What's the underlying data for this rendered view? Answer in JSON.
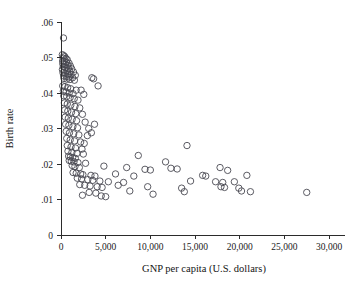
{
  "figure": {
    "width": 362,
    "height": 286,
    "background": "#ffffff",
    "marker_color": "#4a4a52",
    "axis_color": "#2b2b2b",
    "text_color": "#1a1a1a"
  },
  "chart_data": {
    "type": "scatter",
    "title": "",
    "xlabel": "GNP per capita (U.S. dollars)",
    "ylabel": "Birth rate",
    "xlim": [
      0,
      31000
    ],
    "ylim": [
      0,
      0.06
    ],
    "grid": false,
    "legend": null,
    "marker": {
      "shape": "circle-open",
      "size": 3.2,
      "fill": "none",
      "edge_color": "#4a4a52"
    },
    "xticks": [
      0,
      5000,
      10000,
      15000,
      20000,
      25000,
      30000
    ],
    "xticklabels": [
      "0",
      "5,000",
      "10,000",
      "15,000",
      "20,000",
      "25,000",
      "30,000"
    ],
    "yticks": [
      0,
      0.01,
      0.02,
      0.03,
      0.04,
      0.05,
      0.06
    ],
    "yticklabels": [
      "0",
      ".01",
      ".02",
      ".03",
      ".04",
      ".05",
      ".06"
    ],
    "points": [
      [
        280,
        0.0555
      ],
      [
        150,
        0.0508
      ],
      [
        320,
        0.0505
      ],
      [
        430,
        0.0502
      ],
      [
        240,
        0.0498
      ],
      [
        560,
        0.0497
      ],
      [
        700,
        0.0494
      ],
      [
        180,
        0.049
      ],
      [
        350,
        0.0489
      ],
      [
        620,
        0.0486
      ],
      [
        900,
        0.0484
      ],
      [
        200,
        0.0482
      ],
      [
        480,
        0.048
      ],
      [
        760,
        0.0478
      ],
      [
        1050,
        0.0476
      ],
      [
        260,
        0.0474
      ],
      [
        540,
        0.0472
      ],
      [
        830,
        0.047
      ],
      [
        1200,
        0.0468
      ],
      [
        160,
        0.0466
      ],
      [
        400,
        0.0464
      ],
      [
        680,
        0.0463
      ],
      [
        980,
        0.0461
      ],
      [
        1400,
        0.0459
      ],
      [
        220,
        0.0457
      ],
      [
        500,
        0.0455
      ],
      [
        790,
        0.0453
      ],
      [
        1120,
        0.0452
      ],
      [
        1600,
        0.045
      ],
      [
        300,
        0.0448
      ],
      [
        600,
        0.0446
      ],
      [
        880,
        0.0445
      ],
      [
        1300,
        0.0443
      ],
      [
        340,
        0.0441
      ],
      [
        660,
        0.0439
      ],
      [
        1000,
        0.0438
      ],
      [
        1500,
        0.0436
      ],
      [
        3450,
        0.0443
      ],
      [
        3650,
        0.044
      ],
      [
        4150,
        0.042
      ],
      [
        190,
        0.042
      ],
      [
        450,
        0.0418
      ],
      [
        740,
        0.0415
      ],
      [
        1080,
        0.0412
      ],
      [
        1700,
        0.0408
      ],
      [
        260,
        0.0405
      ],
      [
        560,
        0.0403
      ],
      [
        920,
        0.04
      ],
      [
        1350,
        0.0398
      ],
      [
        2250,
        0.0408
      ],
      [
        2550,
        0.0396
      ],
      [
        310,
        0.0392
      ],
      [
        640,
        0.039
      ],
      [
        1020,
        0.0387
      ],
      [
        1480,
        0.0384
      ],
      [
        1900,
        0.038
      ],
      [
        380,
        0.0372
      ],
      [
        700,
        0.0369
      ],
      [
        1100,
        0.0366
      ],
      [
        1560,
        0.0362
      ],
      [
        2100,
        0.0358
      ],
      [
        420,
        0.0352
      ],
      [
        760,
        0.0349
      ],
      [
        1180,
        0.0346
      ],
      [
        1650,
        0.0342
      ],
      [
        2400,
        0.034
      ],
      [
        470,
        0.0332
      ],
      [
        820,
        0.0329
      ],
      [
        1250,
        0.0326
      ],
      [
        1740,
        0.0322
      ],
      [
        2700,
        0.0318
      ],
      [
        520,
        0.0312
      ],
      [
        880,
        0.0309
      ],
      [
        1330,
        0.0305
      ],
      [
        1850,
        0.0302
      ],
      [
        3100,
        0.03
      ],
      [
        3750,
        0.0312
      ],
      [
        580,
        0.0292
      ],
      [
        950,
        0.0288
      ],
      [
        1420,
        0.0285
      ],
      [
        2000,
        0.0282
      ],
      [
        2950,
        0.028
      ],
      [
        3400,
        0.0288
      ],
      [
        640,
        0.0272
      ],
      [
        1030,
        0.0268
      ],
      [
        1520,
        0.0265
      ],
      [
        2200,
        0.0262
      ],
      [
        2600,
        0.0258
      ],
      [
        700,
        0.0252
      ],
      [
        1120,
        0.0248
      ],
      [
        1620,
        0.0245
      ],
      [
        2350,
        0.0242
      ],
      [
        14100,
        0.0252
      ],
      [
        780,
        0.0236
      ],
      [
        1220,
        0.0233
      ],
      [
        1780,
        0.023
      ],
      [
        2500,
        0.0228
      ],
      [
        850,
        0.0222
      ],
      [
        1050,
        0.022
      ],
      [
        1300,
        0.0218
      ],
      [
        1600,
        0.0216
      ],
      [
        8650,
        0.0224
      ],
      [
        920,
        0.021
      ],
      [
        1150,
        0.0208
      ],
      [
        1450,
        0.0206
      ],
      [
        1900,
        0.0204
      ],
      [
        2750,
        0.0202
      ],
      [
        11700,
        0.0206
      ],
      [
        1250,
        0.0196
      ],
      [
        1560,
        0.0193
      ],
      [
        2050,
        0.019
      ],
      [
        4800,
        0.0194
      ],
      [
        7350,
        0.019
      ],
      [
        9400,
        0.0185
      ],
      [
        10000,
        0.0183
      ],
      [
        12300,
        0.0188
      ],
      [
        13000,
        0.0186
      ],
      [
        17800,
        0.019
      ],
      [
        18650,
        0.0182
      ],
      [
        1350,
        0.0176
      ],
      [
        1700,
        0.0174
      ],
      [
        2200,
        0.0172
      ],
      [
        2450,
        0.017
      ],
      [
        3350,
        0.0168
      ],
      [
        3800,
        0.0166
      ],
      [
        6100,
        0.0172
      ],
      [
        8150,
        0.0166
      ],
      [
        15850,
        0.0168
      ],
      [
        16200,
        0.0166
      ],
      [
        20800,
        0.0168
      ],
      [
        1820,
        0.016
      ],
      [
        2300,
        0.0158
      ],
      [
        3000,
        0.0156
      ],
      [
        3550,
        0.0154
      ],
      [
        4350,
        0.0152
      ],
      [
        5300,
        0.015
      ],
      [
        7000,
        0.0148
      ],
      [
        14500,
        0.0152
      ],
      [
        17300,
        0.015
      ],
      [
        18100,
        0.0148
      ],
      [
        19400,
        0.015
      ],
      [
        2100,
        0.0142
      ],
      [
        2650,
        0.014
      ],
      [
        3250,
        0.0138
      ],
      [
        4050,
        0.0136
      ],
      [
        4600,
        0.0134
      ],
      [
        6400,
        0.014
      ],
      [
        9700,
        0.0136
      ],
      [
        13500,
        0.0132
      ],
      [
        17900,
        0.0136
      ],
      [
        18300,
        0.0134
      ],
      [
        19900,
        0.0132
      ],
      [
        2400,
        0.0112
      ],
      [
        3150,
        0.012
      ],
      [
        3900,
        0.0118
      ],
      [
        4500,
        0.011
      ],
      [
        5000,
        0.0108
      ],
      [
        7700,
        0.0124
      ],
      [
        10300,
        0.0115
      ],
      [
        13800,
        0.0122
      ],
      [
        20200,
        0.0124
      ],
      [
        21200,
        0.0122
      ],
      [
        27500,
        0.012
      ]
    ]
  }
}
